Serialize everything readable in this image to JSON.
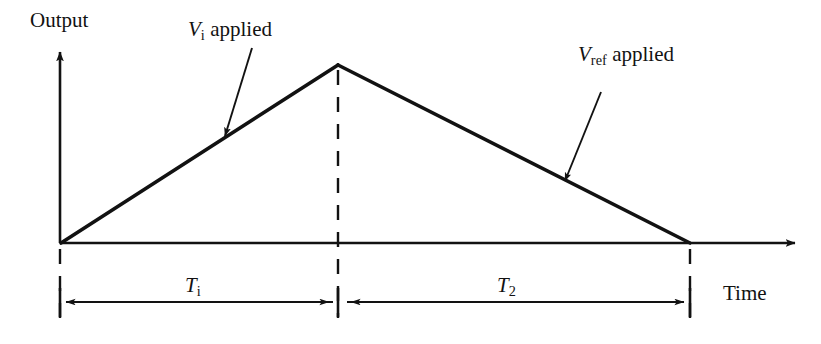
{
  "figure": {
    "type": "dual-slope-integration-waveform",
    "stroke_color": "#121212",
    "background_color": "#ffffff"
  },
  "axes": {
    "y_label": "Output",
    "x_label": "Time",
    "origin": {
      "x": 60,
      "y": 243
    },
    "y_axis_top": {
      "x": 60,
      "y": 50
    },
    "x_axis_end": {
      "x": 800,
      "y": 243
    }
  },
  "waveform": {
    "description": "triangular ramp: integrate up then de-integrate down",
    "points": [
      {
        "x": 60,
        "y": 243
      },
      {
        "x": 338,
        "y": 65
      },
      {
        "x": 690,
        "y": 243
      }
    ]
  },
  "annotations": [
    {
      "id": "vi-applied",
      "var": "V",
      "sub": "i",
      "rest": " applied",
      "arrow_from": {
        "x": 252,
        "y": 48
      },
      "arrow_to": {
        "x": 224,
        "y": 139
      }
    },
    {
      "id": "vref-applied",
      "var": "V",
      "sub": "ref",
      "rest": " applied",
      "arrow_from": {
        "x": 601,
        "y": 92
      },
      "arrow_to": {
        "x": 564,
        "y": 184
      }
    }
  ],
  "dimensions": {
    "line_y": 302,
    "segments": [
      {
        "id": "t1",
        "var": "T",
        "sub": "i",
        "from_x": 60,
        "to_x": 335
      },
      {
        "id": "t2",
        "var": "T",
        "sub": "2",
        "from_x": 341,
        "to_x": 690
      }
    ],
    "dashed_guides": [
      {
        "x": 60,
        "y_from": 248,
        "y_to": 318
      },
      {
        "x": 338,
        "y_from": 68,
        "y_to": 318
      },
      {
        "x": 690,
        "y_from": 248,
        "y_to": 318
      }
    ]
  }
}
